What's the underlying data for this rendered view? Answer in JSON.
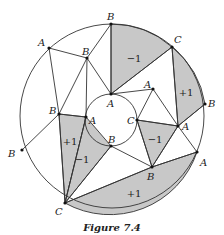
{
  "figure": {
    "caption": "Figure 7.4",
    "outer_circle": {
      "cx": 112,
      "cy": 116,
      "r": 92
    },
    "inner_circle": {
      "cx": 111,
      "cy": 122,
      "r": 25
    },
    "colors": {
      "shade": "#c8c8c8",
      "line": "#333333"
    },
    "points": [
      {
        "id": "oB1",
        "label": "B",
        "x": 111,
        "y": 24,
        "lx": 107,
        "ly": 20
      },
      {
        "id": "oC1",
        "label": "C",
        "x": 172,
        "y": 47,
        "lx": 174,
        "ly": 43
      },
      {
        "id": "oB2",
        "label": "B",
        "x": 205,
        "y": 104,
        "lx": 208,
        "ly": 107
      },
      {
        "id": "oA1",
        "label": "A",
        "x": 197,
        "y": 152,
        "lx": 200,
        "ly": 166
      },
      {
        "id": "oC2",
        "label": "C",
        "x": 65,
        "y": 203,
        "lx": 55,
        "ly": 215
      },
      {
        "id": "oB3",
        "label": "B",
        "x": 22,
        "y": 150,
        "lx": 8,
        "ly": 157
      },
      {
        "id": "oA2",
        "label": "A",
        "x": 49,
        "y": 48,
        "lx": 38,
        "ly": 46
      },
      {
        "id": "iA1",
        "label": "A",
        "x": 111,
        "y": 94,
        "lx": 107,
        "ly": 107
      },
      {
        "id": "iC",
        "label": "C",
        "x": 137,
        "y": 120,
        "lx": 127,
        "ly": 124
      },
      {
        "id": "iB",
        "label": "B",
        "x": 111,
        "y": 146,
        "lx": 108,
        "ly": 143
      },
      {
        "id": "iA2",
        "label": "A",
        "x": 86,
        "y": 117,
        "lx": 89,
        "ly": 124
      },
      {
        "id": "mB1",
        "label": "B",
        "x": 87,
        "y": 58,
        "lx": 82,
        "ly": 55
      },
      {
        "id": "mA1",
        "label": "A",
        "x": 153,
        "y": 89,
        "lx": 144,
        "ly": 88
      },
      {
        "id": "mB2",
        "label": "B",
        "x": 59,
        "y": 114,
        "lx": 49,
        "ly": 114
      },
      {
        "id": "mA2",
        "label": "A",
        "x": 178,
        "y": 126,
        "lx": 182,
        "ly": 130
      },
      {
        "id": "mB3",
        "label": "B",
        "x": 152,
        "y": 167,
        "lx": 147,
        "ly": 180
      }
    ],
    "regions": [
      {
        "label": "−1",
        "x": 134,
        "y": 62
      },
      {
        "label": "+1",
        "x": 186,
        "y": 96
      },
      {
        "label": "+1",
        "x": 70,
        "y": 145
      },
      {
        "label": "−1",
        "x": 82,
        "y": 163
      },
      {
        "label": "−1",
        "x": 155,
        "y": 143
      },
      {
        "label": "+1",
        "x": 134,
        "y": 197
      }
    ]
  }
}
